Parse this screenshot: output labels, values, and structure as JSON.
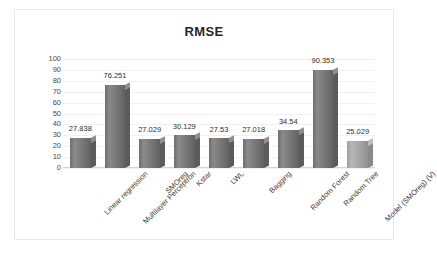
{
  "chart_data": {
    "type": "bar",
    "title": "RMSE",
    "xlabel": "",
    "ylabel": "",
    "ylim": [
      0,
      100
    ],
    "yticks": [
      100,
      90,
      80,
      70,
      60,
      50,
      40,
      30,
      20,
      10,
      0
    ],
    "grid": true,
    "legend": "none",
    "categories": [
      "Linear regression",
      "Multilayer Perceptron",
      "SMOreg",
      "Kstar",
      "LWL",
      "Bagging",
      "Random Forest",
      "Random Tree",
      "Model (SMOreg) (V)"
    ],
    "values": [
      27.838,
      76.251,
      27.029,
      30.129,
      27.53,
      27.018,
      34.54,
      90.353,
      25.029
    ],
    "value_labels": [
      "27.838",
      "76.251",
      "27.029",
      "30.129",
      "27.53",
      "27.018",
      "34.54",
      "90.353",
      "25.029"
    ],
    "bar_colors": [
      "#6f6f6f",
      "#6f6f6f",
      "#6f6f6f",
      "#6f6f6f",
      "#6f6f6f",
      "#6f6f6f",
      "#6f6f6f",
      "#6f6f6f",
      "#a8a8a8"
    ],
    "highlight_index": 8,
    "series": [
      {
        "name": "RMSE",
        "values": [
          27.838,
          76.251,
          27.029,
          30.129,
          27.53,
          27.018,
          34.54,
          90.353,
          25.029
        ]
      }
    ]
  },
  "style": {
    "frame_border": "#e9e9ec",
    "gridline": "#f1f1f3",
    "axis_line": "#d4d4d8",
    "title_color": "#262626",
    "tick_color": "#4a4a4a",
    "label_color": "#2e2e2e",
    "background": "#ffffff"
  }
}
